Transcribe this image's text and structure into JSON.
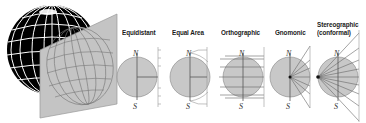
{
  "diagram": {
    "globe": {
      "fill": "#000000",
      "grid_color": "#ffffff"
    },
    "projection_plane": {
      "fill": "#bdbdbd",
      "border": "#8a8a8a",
      "grid_color": "#6a6a6a"
    },
    "disc_color": "#c8c8c8",
    "line_color": "#555555",
    "projections": [
      {
        "id": "equidistant",
        "label": "Equidistant",
        "north": "N",
        "south": "S"
      },
      {
        "id": "equal-area",
        "label": "Equal Area",
        "north": "N",
        "south": "S"
      },
      {
        "id": "orthographic",
        "label": "Orthographic",
        "north": "N",
        "south": "S"
      },
      {
        "id": "gnomonic",
        "label": "Gnomonic",
        "north": "N",
        "south": "S"
      },
      {
        "id": "stereographic",
        "label_line1": "Stereographic",
        "label_line2": "(conformal)",
        "north": "N",
        "south": "S"
      }
    ]
  }
}
